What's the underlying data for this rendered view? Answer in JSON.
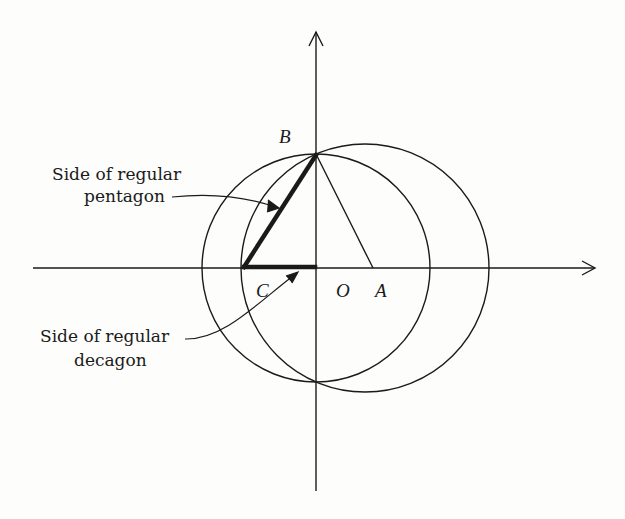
{
  "diagram": {
    "points": {
      "B": "B",
      "C": "C",
      "O": "O",
      "A": "A"
    },
    "annotations": {
      "pentagon_line1": "Side of regular",
      "pentagon_line2": "pentagon",
      "decagon_line1": "Side of regular",
      "decagon_line2": "decagon"
    },
    "colors": {
      "ink": "#1a1a1a",
      "background": "#fdfdfb"
    }
  }
}
